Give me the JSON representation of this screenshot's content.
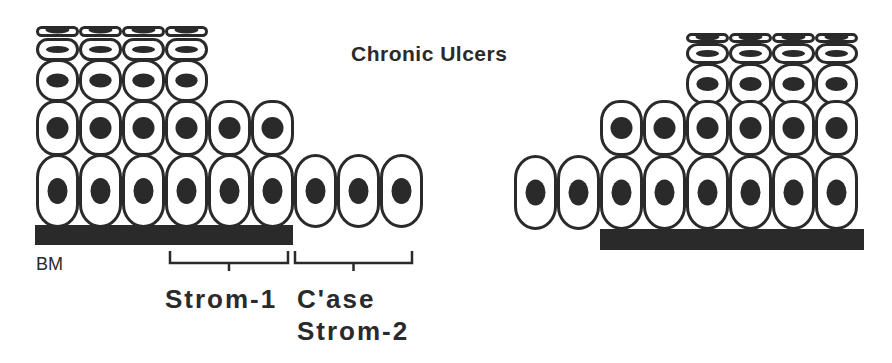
{
  "title": "Chronic Ulcers",
  "labels": {
    "basement_membrane": "BM",
    "stroma_1": "Strom-1",
    "collagenase": "C'ase",
    "stroma_2": "Strom-2"
  },
  "colors": {
    "ink": "#2a2a2a",
    "background": "#ffffff"
  },
  "left_panel": {
    "rows": [
      {
        "layer": "flat-squamous-top",
        "count": 4
      },
      {
        "layer": "flattened",
        "count": 4
      },
      {
        "layer": "round",
        "count": 4
      },
      {
        "layer": "suprabasal",
        "count": 6
      },
      {
        "layer": "basal",
        "count": 9
      }
    ],
    "basement_membrane_under_cells": 6
  },
  "right_panel": {
    "rows": [
      {
        "layer": "flat-squamous-top",
        "count": 4
      },
      {
        "layer": "flattened",
        "count": 4
      },
      {
        "layer": "round",
        "count": 4
      },
      {
        "layer": "suprabasal",
        "count": 6
      },
      {
        "layer": "basal",
        "count": 8
      }
    ],
    "basement_membrane_under_cells": 6
  }
}
